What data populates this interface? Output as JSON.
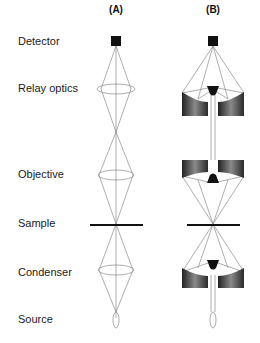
{
  "columns": [
    {
      "label": "(A)",
      "description": "lens-based (refractive) optics"
    },
    {
      "label": "(B)",
      "description": "mirror-based (reflective) optics"
    }
  ],
  "rows": [
    {
      "label": "Detector",
      "y": 41
    },
    {
      "label": "Relay optics",
      "y": 89
    },
    {
      "label": "Objective",
      "y": 175
    },
    {
      "label": "Sample",
      "y": 224
    },
    {
      "label": "Condenser",
      "y": 273
    },
    {
      "label": "Source",
      "y": 320
    }
  ],
  "colors": {
    "ink": "#111111",
    "ray": "#777777",
    "mirror_dark": "#2a2a2a",
    "mirror_light": "#8a8a8a"
  }
}
